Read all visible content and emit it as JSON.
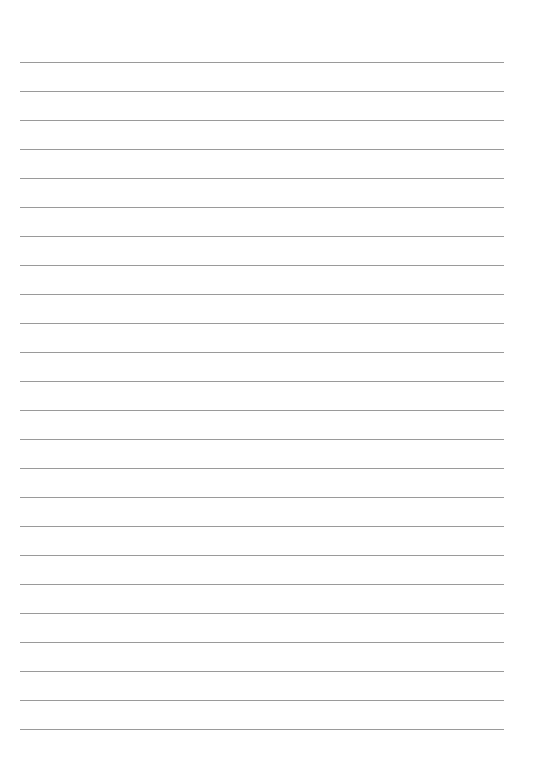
{
  "page": {
    "type": "lined-paper",
    "background_color": "#ffffff",
    "line_color": "#9a9a9a",
    "line_count": 24,
    "first_line_y": 62,
    "line_spacing": 29,
    "line_left": 20,
    "line_right": 504,
    "text": ""
  }
}
